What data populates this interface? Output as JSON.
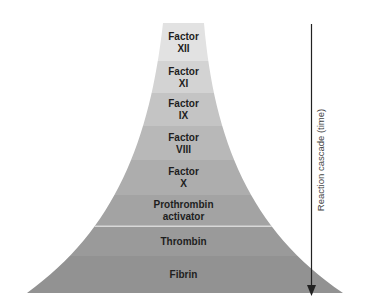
{
  "diagram": {
    "type": "cascade-pyramid",
    "direction_label": "Reaction cascade (time)",
    "stages": [
      {
        "lines": [
          "Factor",
          "XII"
        ],
        "color": "#e2e2e2"
      },
      {
        "lines": [
          "Factor",
          "XI"
        ],
        "color": "#d3d3d3"
      },
      {
        "lines": [
          "Factor",
          "IX"
        ],
        "color": "#c4c4c4"
      },
      {
        "lines": [
          "Factor",
          "VIII"
        ],
        "color": "#b8b8b8"
      },
      {
        "lines": [
          "Factor",
          "X"
        ],
        "color": "#adadad"
      },
      {
        "lines": [
          "Prothrombin",
          "activator"
        ],
        "color": "#a3a3a3"
      },
      {
        "lines": [
          "Thrombin"
        ],
        "color": "#9a9a9a"
      },
      {
        "lines": [
          "Fibrin"
        ],
        "color": "#929292"
      }
    ],
    "colors": {
      "arrow": "#222222",
      "text": "#1e1e1e",
      "separator_highlight": "#d8d8d8"
    }
  }
}
